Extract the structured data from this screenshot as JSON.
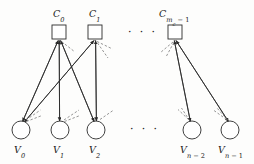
{
  "figure": {
    "type": "tanner-graph",
    "background_color": "#fdfdfc",
    "stroke_color": "#2b2b2b",
    "dashed_color": "#6e6e6e",
    "check_nodes": [
      {
        "id": "c0",
        "label_base": "C",
        "label_sub": "0",
        "x": 59,
        "y": 32,
        "size": 14
      },
      {
        "id": "c1",
        "label_base": "C",
        "label_sub": "1",
        "x": 95,
        "y": 32,
        "size": 14
      },
      {
        "id": "cm",
        "label_base": "C",
        "label_sub": "m",
        "label_sub_sub": "c",
        "label_sub_tail": " − 1",
        "x": 175,
        "y": 32,
        "size": 14
      }
    ],
    "variable_nodes": [
      {
        "id": "v0",
        "label_base": "V",
        "label_sub": "0",
        "x": 21,
        "y": 130,
        "r": 9
      },
      {
        "id": "v1",
        "label_base": "V",
        "label_sub": "1",
        "x": 60,
        "y": 130,
        "r": 9
      },
      {
        "id": "v2",
        "label_base": "V",
        "label_sub": "2",
        "x": 96,
        "y": 130,
        "r": 9
      },
      {
        "id": "vn2",
        "label_base": "V",
        "label_sub": "n − 2",
        "x": 192,
        "y": 130,
        "r": 9
      },
      {
        "id": "vn1",
        "label_base": "V",
        "label_sub": "n − 1",
        "x": 230,
        "y": 130,
        "r": 9
      }
    ],
    "edges": [
      {
        "check": "c0",
        "variable": "v0"
      },
      {
        "check": "c0",
        "variable": "v1"
      },
      {
        "check": "c0",
        "variable": "v2"
      },
      {
        "check": "c1",
        "variable": "v0"
      },
      {
        "check": "c1",
        "variable": "v2"
      },
      {
        "check": "cm",
        "variable": "vn2"
      },
      {
        "check": "cm",
        "variable": "vn1"
      }
    ],
    "ellipses": [
      {
        "id": "top-ellipsis",
        "text": "· · ·",
        "x": 128,
        "y": 27
      },
      {
        "id": "bottom-ellipsis",
        "text": "· · ·",
        "x": 130,
        "y": 124
      }
    ],
    "labels": {
      "c0": "C0",
      "c1": "C1",
      "cm": "Cmc−1",
      "v0": "V0",
      "v1": "V1",
      "v2": "V2",
      "vn2": "Vn−2",
      "vn1": "Vn−1"
    }
  }
}
